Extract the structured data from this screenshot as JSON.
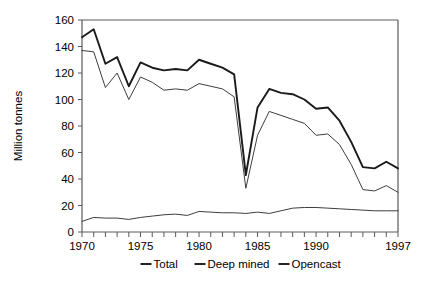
{
  "chart_data": {
    "type": "line",
    "title": "",
    "xlabel": "",
    "ylabel": "Million tonnes",
    "xlim": [
      1970,
      1997
    ],
    "ylim": [
      0,
      160
    ],
    "ytick_step": 20,
    "yticks": [
      0,
      20,
      40,
      60,
      80,
      100,
      120,
      140,
      160
    ],
    "ytick_labels": [
      "0",
      "20",
      "40",
      "60",
      "80",
      "100",
      "120",
      "140",
      "160"
    ],
    "xticks": [
      1970,
      1975,
      1980,
      1985,
      1990,
      1997
    ],
    "xtick_labels": [
      "1970",
      "1975",
      "1980",
      "1985",
      "1990",
      "1997"
    ],
    "xtick_minor_step": 1,
    "grid": false,
    "legend_position": "bottom",
    "x": [
      1970,
      1971,
      1972,
      1973,
      1974,
      1975,
      1976,
      1977,
      1978,
      1979,
      1980,
      1981,
      1982,
      1983,
      1984,
      1985,
      1986,
      1987,
      1988,
      1989,
      1990,
      1991,
      1992,
      1993,
      1994,
      1995,
      1996,
      1997
    ],
    "series": [
      {
        "name": "Total",
        "color": "#1a1a1a",
        "values": [
          147,
          153,
          127,
          132,
          110,
          128,
          124,
          122,
          123,
          122,
          130,
          127,
          124,
          119,
          43,
          94,
          108,
          105,
          104,
          100,
          93,
          94,
          84,
          68,
          49,
          48,
          53,
          48
        ]
      },
      {
        "name": "Deep mined",
        "color": "#3d3d3d",
        "values": [
          137,
          136,
          109,
          120,
          100,
          117,
          113,
          107,
          108,
          107,
          112,
          110,
          108,
          102,
          33,
          73,
          91,
          88,
          85,
          82,
          73,
          74,
          66,
          51,
          32,
          31,
          35,
          30
        ]
      },
      {
        "name": "Opencast",
        "color": "#3d3d3d",
        "values": [
          8,
          11,
          10.5,
          10.5,
          9.5,
          11,
          12,
          13,
          13.5,
          12.5,
          15.5,
          15,
          14.5,
          14.5,
          14,
          15,
          14,
          16,
          18,
          18.5,
          18.5,
          18,
          17.5,
          17,
          16.5,
          16,
          16,
          16
        ]
      }
    ]
  },
  "legend": {
    "items": [
      {
        "label": "Total"
      },
      {
        "label": "Deep mined"
      },
      {
        "label": "Opencast"
      }
    ]
  }
}
